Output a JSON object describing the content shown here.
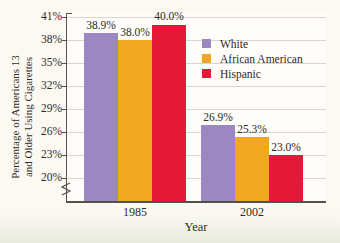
{
  "theme": {
    "page_background": "#fbf9f2",
    "grid_color": "#d9d6cf",
    "axis_color": "#55504a",
    "text_color": "#2f2b26"
  },
  "chart_data": {
    "type": "bar",
    "title": "",
    "xlabel": "Year",
    "ylabel": "Percentage of Americans 13 and Older Using Cigarettes",
    "ylabel_lines": [
      "Percentage of Americans 13",
      "and Older Using Cigarettes"
    ],
    "categories": [
      "1985",
      "2002"
    ],
    "series": [
      {
        "name": "White",
        "color": "#9c87c1",
        "values": [
          38.9,
          26.9
        ]
      },
      {
        "name": "African American",
        "color": "#efa820",
        "values": [
          38.0,
          25.3
        ]
      },
      {
        "name": "Hispanic",
        "color": "#e51937",
        "values": [
          40.0,
          23.0
        ]
      }
    ],
    "value_labels": [
      [
        "38.9%",
        "38.0%",
        "40.0%"
      ],
      [
        "26.9%",
        "25.3%",
        "23.0%"
      ]
    ],
    "y_ticks": [
      "41%",
      "38%",
      "35%",
      "32%",
      "29%",
      "26%",
      "23%",
      "20%"
    ],
    "y_tick_values": [
      41,
      38,
      35,
      32,
      29,
      26,
      23,
      20
    ],
    "ylim": [
      20,
      41
    ],
    "axis_break": true,
    "grid": true,
    "legend_position": "upper right"
  }
}
